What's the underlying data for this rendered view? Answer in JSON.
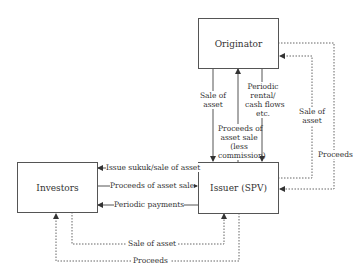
{
  "diagram": {
    "nodes": {
      "originator": "Originator",
      "issuer": "Issuer (SPV)",
      "investors": "Investors"
    },
    "flows": {
      "originator_issuer_sale": [
        "Sale of",
        "asset"
      ],
      "issuer_originator_proceeds": [
        "Proceeds of",
        "asset sale",
        "(less",
        "commission)"
      ],
      "originator_issuer_rental": [
        "Periodic",
        "rental/",
        "cash flows",
        "etc."
      ],
      "right_inner_sale": [
        "Sale of",
        "asset"
      ],
      "right_outer_proceeds": "Proceeds",
      "issuer_investors_sukuk": "Issue sukuk/sale of asset",
      "investors_issuer_proceeds": "Proceeds of asset sale",
      "issuer_investors_periodic": "Periodic payments",
      "bottom_sale": "Sale of asset",
      "bottom_proceeds": "Proceeds"
    },
    "colors": {
      "line": "#555555",
      "text": "#333333"
    }
  }
}
